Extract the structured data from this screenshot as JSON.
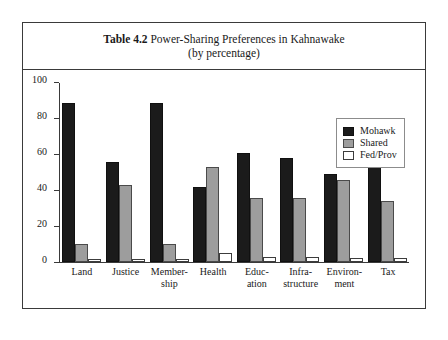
{
  "figure": {
    "caption_prefix": "Table 4.2",
    "caption_main": " Power-Sharing Preferences in Kahnawake",
    "caption_sub": "(by percentage)"
  },
  "legend": {
    "position": "top-right",
    "items": [
      {
        "label": "Mohawk",
        "color": "#1b1b1b"
      },
      {
        "label": "Shared",
        "color": "#9d9d9d"
      },
      {
        "label": "Fed/Prov",
        "color": "#ffffff"
      }
    ]
  },
  "axis": {
    "y_ticks": [
      "0",
      "20",
      "40",
      "60",
      "80",
      "100"
    ],
    "categories_wrapped": [
      [
        "Land"
      ],
      [
        "Justice"
      ],
      [
        "Member-",
        "ship"
      ],
      [
        "Health"
      ],
      [
        "Educ-",
        "ation"
      ],
      [
        "Infra-",
        "structure"
      ],
      [
        "Environ-",
        "ment"
      ],
      [
        "Tax"
      ]
    ]
  },
  "chart_data": {
    "type": "bar",
    "title": "Table 4.2 Power-Sharing Preferences in Kahnawake (by percentage)",
    "xlabel": "",
    "ylabel": "",
    "ylim": [
      0,
      100
    ],
    "yticks": [
      0,
      20,
      40,
      60,
      80,
      100
    ],
    "grid": false,
    "legend_position": "upper right",
    "categories": [
      "Land",
      "Membership",
      "Justice",
      "Health",
      "Education",
      "Infrastructure",
      "Environment",
      "Tax"
    ],
    "categories_display": [
      "Land",
      "Justice",
      "Member-ship",
      "Health",
      "Educ-ation",
      "Infra-structure",
      "Environ-ment",
      "Tax"
    ],
    "series": [
      {
        "name": "Mohawk",
        "color": "#1b1b1b",
        "values": [
          89,
          56,
          89,
          42,
          61,
          58,
          49,
          64
        ]
      },
      {
        "name": "Shared",
        "color": "#9d9d9d",
        "values": [
          10,
          43,
          10,
          53,
          36,
          36,
          46,
          34
        ]
      },
      {
        "name": "Fed/Prov",
        "color": "#ffffff",
        "values": [
          1,
          1,
          1,
          5,
          3,
          3,
          2,
          2
        ]
      }
    ]
  }
}
